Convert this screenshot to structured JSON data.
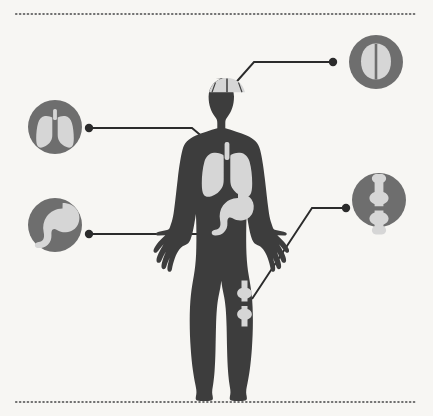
{
  "diagram": {
    "type": "anatomical-infographic",
    "background_color": "#f7f6f3",
    "body_color": "#3d3d3d",
    "organ_color": "#d6d6d6",
    "badge_color": "#6e6e6e",
    "line_color": "#2b2b2b",
    "border": {
      "style": "dotted",
      "color": "#6e6e6e",
      "top_y": 14,
      "bottom_y": 402,
      "left_x": 16,
      "right_x": 417
    },
    "figure": {
      "name": "female-body-silhouette",
      "center_x": 227,
      "top_y": 78,
      "bottom_y": 390
    },
    "callouts": [
      {
        "id": "brain",
        "label": "brain-icon",
        "organ": "Brain",
        "badge_cx": 376,
        "badge_cy": 62,
        "badge_r": 27,
        "dot_x": 333,
        "dot_y": 62,
        "anchor_x": 231,
        "anchor_y": 88,
        "elbow_x": 254,
        "path": "M231,88 L254,62 L333,62"
      },
      {
        "id": "lungs",
        "label": "lungs-icon",
        "organ": "Lungs",
        "badge_cx": 55,
        "badge_cy": 127,
        "badge_r": 27,
        "dot_x": 89,
        "dot_y": 128,
        "anchor_x": 211,
        "anchor_y": 143,
        "elbow_x": 192,
        "path": "M89,128 L192,128 L211,143"
      },
      {
        "id": "stomach",
        "label": "stomach-icon",
        "organ": "Stomach",
        "badge_cx": 55,
        "badge_cy": 225,
        "badge_r": 27,
        "dot_x": 89,
        "dot_y": 234,
        "anchor_x": 196,
        "anchor_y": 234,
        "elbow_x": 196,
        "path": "M89,234 L196,234"
      },
      {
        "id": "knee",
        "label": "knee-joint-icon",
        "organ": "Knee joint",
        "badge_cx": 379,
        "badge_cy": 200,
        "badge_r": 27,
        "dot_x": 346,
        "dot_y": 208,
        "anchor_x": 253,
        "anchor_y": 298,
        "elbow_x": 312,
        "path": "M253,298 L312,208 L346,208"
      }
    ]
  }
}
